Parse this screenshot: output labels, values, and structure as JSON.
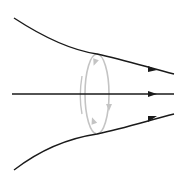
{
  "diagram": {
    "colors": {
      "background": "#ffffff",
      "field_line": "#1a1a1a",
      "loop": "#bdbdbd"
    },
    "field_lines": [
      {
        "name": "upper-field-line",
        "path": "M14,18 C40,35 70,50 97,54 C125,60 150,68 174,74",
        "arrow_at": [
          154,
          70
        ]
      },
      {
        "name": "middle-field-line",
        "path": "M12,94 L174,94",
        "arrow_at": [
          154,
          94
        ]
      },
      {
        "name": "lower-field-line",
        "path": "M14,170 C40,150 70,138 97,134 C125,128 150,120 174,114",
        "arrow_at": [
          154,
          118
        ]
      }
    ],
    "loop": {
      "cx": 97,
      "cy": 94,
      "rx": 12,
      "ry": 40,
      "arrows": [
        "down-left-top",
        "up-left-bottom",
        "down-right"
      ]
    }
  }
}
